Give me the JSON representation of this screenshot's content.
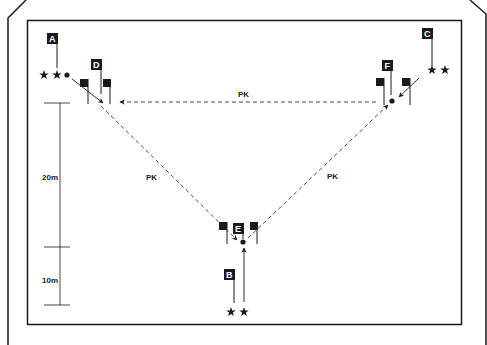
{
  "diagram": {
    "colors": {
      "ink": "#1a1a1a",
      "paper": "#ffffff",
      "dash": "#333333"
    },
    "stations": [
      {
        "id": "A",
        "label": "A"
      },
      {
        "id": "B",
        "label": "B"
      },
      {
        "id": "C",
        "label": "C"
      },
      {
        "id": "D",
        "label": "D"
      },
      {
        "id": "E",
        "label": "E"
      },
      {
        "id": "F",
        "label": "F"
      }
    ],
    "passes": [
      {
        "label": "PK"
      },
      {
        "label": "PK"
      },
      {
        "label": "PK"
      }
    ],
    "scale": {
      "upper": "20m",
      "lower": "10m"
    },
    "icons": {
      "player": "star-icon",
      "ball": "ball-icon",
      "flag": "flag-icon"
    }
  }
}
